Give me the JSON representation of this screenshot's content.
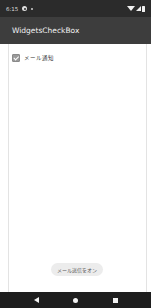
{
  "status_bar": {
    "time": "6:15",
    "icons": [
      "settings-icon",
      "notification-dot-icon",
      "wifi-icon",
      "signal-icon",
      "battery-icon"
    ]
  },
  "app_bar": {
    "title": "WidgetsCheckBox"
  },
  "content": {
    "checkbox": {
      "label": "メール通知",
      "checked": true
    }
  },
  "toast": {
    "message": "メール送信をオン"
  },
  "nav_bar": {
    "buttons": [
      "back",
      "home",
      "recents"
    ]
  }
}
